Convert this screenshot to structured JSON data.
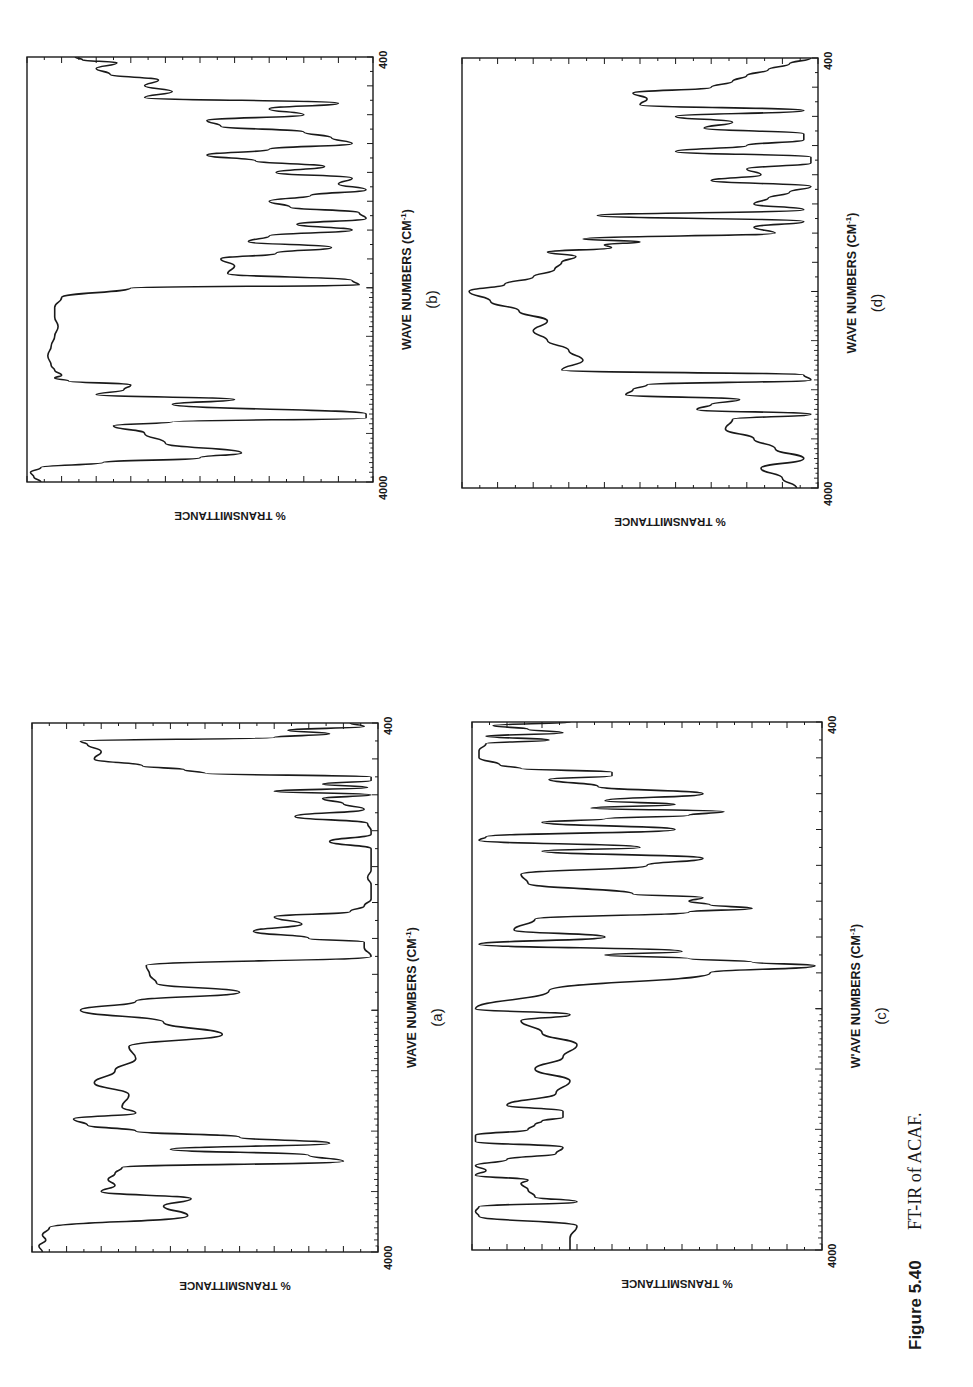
{
  "figure": {
    "caption_label": "Figure 5.40",
    "caption_text": "FT-IR of ACAF.",
    "orientation": "rotated 90° counter-clockwise on page"
  },
  "colors": {
    "ink": "#1a1a1a",
    "background": "#ffffff"
  },
  "chart_data": [
    {
      "id": "a",
      "type": "line",
      "panel_label": "(a)",
      "title": "",
      "xlabel": "WAVE NUMBERS (CM⁻¹)",
      "xlabel_main": "WAVE NUMBERS (CM",
      "xlabel_sup": "-1",
      "xlabel_close": ")",
      "ylabel": "% TRANSMITTANCE",
      "x_tick_labels": [
        "4000",
        "400"
      ],
      "xlim": [
        4000,
        400
      ],
      "ylim": [
        0,
        100
      ],
      "grid": false,
      "legend": null,
      "box": {
        "x0": 32,
        "x1": 378,
        "y0": 723,
        "y1": 1252
      },
      "x": [
        4000,
        3950,
        3900,
        3860,
        3800,
        3700,
        3620,
        3560,
        3500,
        3450,
        3400,
        3350,
        3300,
        3250,
        3200,
        3150,
        3100,
        3050,
        3000,
        2950,
        2900,
        2850,
        2800,
        2700,
        2600,
        2500,
        2400,
        2300,
        2200,
        2100,
        2000,
        1950,
        1900,
        1850,
        1800,
        1750,
        1700,
        1650,
        1620,
        1600,
        1560,
        1520,
        1480,
        1450,
        1420,
        1380,
        1340,
        1300,
        1260,
        1220,
        1180,
        1140,
        1100,
        1060,
        1020,
        1000,
        960,
        920,
        880,
        850,
        820,
        800,
        780,
        760,
        740,
        720,
        700,
        680,
        660,
        640,
        600,
        560,
        520,
        500,
        480,
        460,
        440,
        420,
        400
      ],
      "y": [
        97,
        98,
        96,
        97,
        95,
        55,
        62,
        54,
        80,
        76,
        78,
        76,
        74,
        10,
        20,
        60,
        14,
        40,
        70,
        84,
        88,
        70,
        74,
        72,
        82,
        76,
        70,
        72,
        45,
        62,
        86,
        70,
        40,
        64,
        66,
        67,
        2,
        4,
        4,
        20,
        36,
        22,
        30,
        8,
        4,
        2,
        2,
        2,
        3,
        2,
        2,
        2,
        2,
        14,
        2,
        2,
        3,
        24,
        4,
        10,
        16,
        2,
        30,
        3,
        16,
        2,
        2,
        50,
        56,
        68,
        82,
        80,
        84,
        86,
        30,
        14,
        26,
        4,
        8
      ]
    },
    {
      "id": "b",
      "type": "line",
      "panel_label": "(b)",
      "title": "",
      "xlabel": "WAVE NUMBERS (CM⁻¹)",
      "xlabel_main": "WAVE NUMBERS (CM",
      "xlabel_sup": "-1",
      "xlabel_close": ")",
      "ylabel": "% TRANSMITTANCE",
      "x_tick_labels": [
        "4000",
        "400"
      ],
      "xlim": [
        4000,
        400
      ],
      "ylim": [
        0,
        100
      ],
      "grid": false,
      "legend": null,
      "box": {
        "x0": 27,
        "x1": 373,
        "y0": 57,
        "y1": 482
      },
      "x": [
        4000,
        3950,
        3900,
        3850,
        3800,
        3750,
        3700,
        3600,
        3500,
        3420,
        3380,
        3340,
        3300,
        3200,
        3150,
        3100,
        3050,
        3000,
        2960,
        2930,
        2900,
        2850,
        2800,
        2700,
        2600,
        2500,
        2400,
        2300,
        2200,
        2100,
        2000,
        1980,
        1950,
        1900,
        1850,
        1800,
        1760,
        1720,
        1680,
        1640,
        1600,
        1560,
        1520,
        1480,
        1440,
        1400,
        1360,
        1320,
        1280,
        1240,
        1200,
        1160,
        1120,
        1080,
        1040,
        1000,
        960,
        920,
        880,
        840,
        800,
        760,
        720,
        680,
        640,
        600,
        560,
        520,
        480,
        440,
        420,
        400
      ],
      "y": [
        96,
        98,
        99,
        96,
        78,
        50,
        38,
        60,
        66,
        75,
        58,
        2,
        2,
        58,
        40,
        80,
        72,
        70,
        88,
        92,
        90,
        92,
        93,
        94,
        93,
        92,
        91,
        92,
        92,
        90,
        70,
        4,
        6,
        42,
        40,
        44,
        28,
        12,
        36,
        30,
        6,
        22,
        2,
        4,
        24,
        30,
        18,
        2,
        10,
        6,
        28,
        14,
        34,
        48,
        30,
        6,
        12,
        20,
        44,
        48,
        20,
        30,
        10,
        66,
        58,
        66,
        62,
        76,
        80,
        74,
        84,
        86
      ]
    },
    {
      "id": "c",
      "type": "line",
      "panel_label": "(c)",
      "title": "",
      "xlabel": "WAVE NUMBERS (CM⁻¹)",
      "xlabel_main": "W'AVE NUMBERS (CM",
      "xlabel_sup": "-1",
      "xlabel_close": ")",
      "ylabel": "% TRANSMITTANCE",
      "x_tick_labels": [
        "4000",
        "400"
      ],
      "xlim": [
        4000,
        400
      ],
      "ylim": [
        0,
        100
      ],
      "grid": false,
      "legend": null,
      "box": {
        "x0": 472,
        "x1": 822,
        "y0": 722,
        "y1": 1250
      },
      "x": [
        4000,
        3900,
        3800,
        3720,
        3680,
        3640,
        3600,
        3560,
        3500,
        3450,
        3420,
        3380,
        3340,
        3300,
        3250,
        3200,
        3150,
        3100,
        3050,
        3000,
        2960,
        2930,
        2900,
        2850,
        2800,
        2700,
        2600,
        2500,
        2400,
        2300,
        2200,
        2100,
        2050,
        2000,
        1900,
        1800,
        1760,
        1740,
        1720,
        1700,
        1680,
        1640,
        1600,
        1560,
        1500,
        1460,
        1440,
        1420,
        1400,
        1380,
        1360,
        1300,
        1250,
        1200,
        1160,
        1120,
        1100,
        1060,
        1040,
        1000,
        960,
        940,
        920,
        900,
        880,
        860,
        840,
        800,
        760,
        720,
        700,
        680,
        660,
        640,
        600,
        560,
        520,
        500,
        480,
        460,
        440,
        420,
        400
      ],
      "y": [
        72,
        72,
        70,
        98,
        99,
        98,
        70,
        82,
        84,
        86,
        84,
        99,
        96,
        99,
        90,
        76,
        74,
        99,
        99,
        84,
        82,
        80,
        74,
        74,
        90,
        76,
        72,
        82,
        74,
        70,
        80,
        86,
        72,
        99,
        78,
        32,
        2,
        20,
        38,
        62,
        40,
        98,
        62,
        88,
        82,
        38,
        20,
        32,
        38,
        34,
        54,
        84,
        86,
        50,
        34,
        80,
        52,
        98,
        96,
        42,
        80,
        62,
        38,
        28,
        66,
        42,
        62,
        34,
        64,
        78,
        60,
        60,
        86,
        92,
        98,
        98,
        96,
        78,
        96,
        74,
        84,
        94,
        72
      ]
    },
    {
      "id": "d",
      "type": "line",
      "panel_label": "(d)",
      "title": "",
      "xlabel": "WAVE NUMBERS (CM⁻¹)",
      "xlabel_main": "WAVE NUMBERS (CM",
      "xlabel_sup": "-1",
      "xlabel_close": ")",
      "ylabel": "% TRANSMITTANCE",
      "x_tick_labels": [
        "4000",
        "400"
      ],
      "xlim": [
        4000,
        400
      ],
      "ylim": [
        0,
        100
      ],
      "grid": false,
      "legend": null,
      "box": {
        "x0": 462,
        "x1": 818,
        "y0": 58,
        "y1": 488
      },
      "x": [
        4000,
        3900,
        3800,
        3700,
        3600,
        3500,
        3400,
        3300,
        3250,
        3200,
        3150,
        3100,
        3050,
        3000,
        2950,
        2900,
        2850,
        2800,
        2700,
        2600,
        2500,
        2400,
        2300,
        2200,
        2100,
        2000,
        1950,
        1900,
        1850,
        1800,
        1760,
        1730,
        1700,
        1680,
        1660,
        1640,
        1600,
        1560,
        1520,
        1480,
        1440,
        1400,
        1360,
        1320,
        1280,
        1240,
        1200,
        1160,
        1120,
        1080,
        1040,
        1000,
        960,
        920,
        880,
        840,
        800,
        760,
        720,
        680,
        640,
        600,
        560,
        520,
        480,
        440,
        400
      ],
      "y": [
        6,
        10,
        16,
        4,
        12,
        18,
        26,
        24,
        2,
        34,
        30,
        22,
        54,
        52,
        48,
        2,
        4,
        72,
        66,
        70,
        76,
        80,
        76,
        84,
        92,
        98,
        88,
        80,
        74,
        72,
        68,
        76,
        58,
        60,
        50,
        66,
        12,
        18,
        4,
        62,
        4,
        18,
        14,
        8,
        2,
        30,
        16,
        20,
        2,
        2,
        40,
        20,
        4,
        4,
        32,
        24,
        40,
        4,
        50,
        48,
        52,
        30,
        24,
        20,
        14,
        8,
        2
      ]
    }
  ]
}
